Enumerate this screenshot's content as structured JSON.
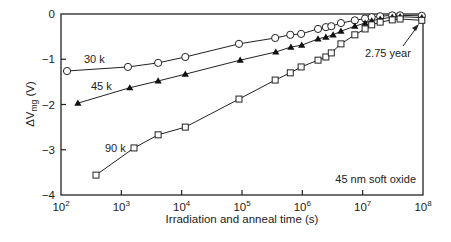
{
  "chart_data": {
    "type": "line",
    "title": "",
    "xlabel": "Irradiation and anneal time (s)",
    "ylabel": "ΔV_mg (V)",
    "xscale": "log",
    "xlim": [
      100,
      100000000
    ],
    "ylim": [
      -4,
      0
    ],
    "grid": false,
    "x_ticks": [
      "10^2",
      "10^3",
      "10^4",
      "10^5",
      "10^6",
      "10^7",
      "10^8"
    ],
    "y_ticks": [
      "0",
      "−1",
      "−2",
      "−3",
      "−4"
    ],
    "annotations": [
      {
        "text": "2.75 year",
        "arrow_to": [
          7.95,
          -0.12
        ]
      },
      {
        "text": "45 nm soft oxide"
      }
    ],
    "series": [
      {
        "name": "30 k",
        "marker": "open-circle",
        "log10_x": [
          2.1,
          3.11,
          3.61,
          4.06,
          4.95,
          5.55,
          5.8,
          5.98,
          6.26,
          6.39,
          6.48,
          6.64,
          6.87,
          7.04,
          7.15,
          7.29,
          7.49,
          7.62,
          7.98
        ],
        "values": [
          -1.26,
          -1.17,
          -1.08,
          -0.95,
          -0.66,
          -0.53,
          -0.46,
          -0.44,
          -0.33,
          -0.29,
          -0.27,
          -0.2,
          -0.14,
          -0.1,
          -0.07,
          -0.05,
          -0.03,
          -0.03,
          -0.04
        ]
      },
      {
        "name": "45 k",
        "marker": "filled-triangle",
        "log10_x": [
          2.28,
          3.14,
          3.61,
          4.06,
          4.97,
          5.56,
          5.81,
          5.99,
          6.26,
          6.39,
          6.51,
          6.64,
          6.87,
          7.04,
          7.15,
          7.29,
          7.49,
          7.62,
          7.98
        ],
        "values": [
          -1.97,
          -1.63,
          -1.48,
          -1.33,
          -1.02,
          -0.84,
          -0.73,
          -0.69,
          -0.55,
          -0.51,
          -0.46,
          -0.38,
          -0.27,
          -0.2,
          -0.15,
          -0.11,
          -0.07,
          -0.06,
          -0.08
        ]
      },
      {
        "name": "90 k",
        "marker": "open-square",
        "log10_x": [
          2.58,
          3.21,
          3.61,
          4.06,
          4.95,
          5.55,
          5.8,
          5.98,
          6.26,
          6.39,
          6.48,
          6.64,
          6.87,
          7.04,
          7.15,
          7.29,
          7.49,
          7.62,
          7.98
        ],
        "values": [
          -3.56,
          -2.96,
          -2.67,
          -2.5,
          -1.88,
          -1.46,
          -1.3,
          -1.17,
          -1.02,
          -0.95,
          -0.86,
          -0.66,
          -0.46,
          -0.33,
          -0.24,
          -0.18,
          -0.13,
          -0.11,
          -0.14
        ]
      }
    ]
  },
  "labels": {
    "x_axis_title": "Irradiation and anneal time (s)",
    "y_axis_delta": "ΔV",
    "y_axis_sub": "mg",
    "y_axis_unit": " (V)",
    "annotation_year": "2.75 year",
    "annotation_oxide": "45 nm soft oxide",
    "series_30": "30 k",
    "series_45": "45 k",
    "series_90": "90 k"
  }
}
